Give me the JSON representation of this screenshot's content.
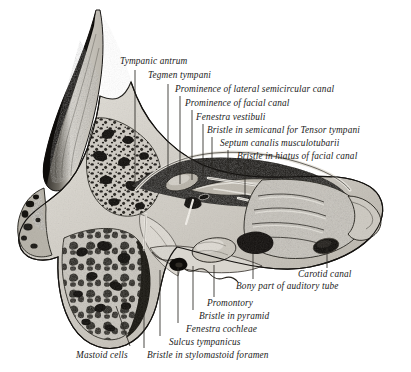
{
  "plate": {
    "title": "Dissected left temporal bone, tympanic cavity exposed",
    "background_color": "#ffffff",
    "ink_color": "#1a1a1a",
    "bone_light": "#d8d5ce",
    "bone_mid": "#a9a49a",
    "bone_dark": "#4a4640",
    "cavity_black": "#141210",
    "bristle_white": "#f4f2ec"
  },
  "labels": [
    {
      "id": "tympanic-antrum",
      "text": "Tympanic antrum",
      "x": 120,
      "y": 56,
      "align": "left",
      "leader": {
        "x1": 135,
        "y1": 70,
        "x2": 135,
        "y2": 186
      }
    },
    {
      "id": "tegmen-tympani",
      "text": "Tegmen tympani",
      "x": 148,
      "y": 70,
      "align": "left",
      "leader": {
        "x1": 168,
        "y1": 84,
        "x2": 168,
        "y2": 174
      }
    },
    {
      "id": "prominence-lateral-semicircular-canal",
      "text": "Prominence of lateral semicircular canal",
      "x": 175,
      "y": 84,
      "align": "left",
      "leader": {
        "x1": 180,
        "y1": 96,
        "x2": 180,
        "y2": 184
      }
    },
    {
      "id": "prominence-facial-canal",
      "text": "Prominence of facial canal",
      "x": 185,
      "y": 98,
      "align": "left",
      "leader": {
        "x1": 192,
        "y1": 110,
        "x2": 192,
        "y2": 180
      }
    },
    {
      "id": "fenestra-vestibuli",
      "text": "Fenestra vestibuli",
      "x": 196,
      "y": 112,
      "align": "left",
      "leader": {
        "x1": 203,
        "y1": 124,
        "x2": 203,
        "y2": 178
      }
    },
    {
      "id": "bristle-semicanal-tensor-tympani",
      "text": "Bristle in semicanal for Tensor tympani",
      "x": 207,
      "y": 125,
      "align": "left",
      "leader": {
        "x1": 212,
        "y1": 137,
        "x2": 212,
        "y2": 176
      }
    },
    {
      "id": "septum-canalis-musculotubarii",
      "text": "Septum canalis musculotubarii",
      "x": 220,
      "y": 138,
      "align": "left",
      "leader": {
        "x1": 228,
        "y1": 150,
        "x2": 228,
        "y2": 176
      }
    },
    {
      "id": "bristle-hiatus-facial-canal",
      "text": "Bristle in hiatus of facial canal",
      "x": 237,
      "y": 151,
      "align": "left",
      "leader": {
        "x1": 245,
        "y1": 163,
        "x2": 245,
        "y2": 197
      }
    },
    {
      "id": "carotid-canal",
      "text": "Carotid canal",
      "x": 298,
      "y": 269,
      "align": "left",
      "leader": {
        "x1": 327,
        "y1": 268,
        "x2": 327,
        "y2": 248
      }
    },
    {
      "id": "bony-part-auditory-tube",
      "text": "Bony part of auditory tube",
      "x": 236,
      "y": 281,
      "align": "left",
      "leader": {
        "x1": 253,
        "y1": 279,
        "x2": 253,
        "y2": 253
      }
    },
    {
      "id": "promontory",
      "text": "Promontory",
      "x": 207,
      "y": 298,
      "align": "left",
      "leader": {
        "x1": 214,
        "y1": 297,
        "x2": 214,
        "y2": 265
      }
    },
    {
      "id": "bristle-in-pyramid",
      "text": "Bristle in pyramid",
      "x": 199,
      "y": 311,
      "align": "left",
      "leader": {
        "x1": 193,
        "y1": 310,
        "x2": 193,
        "y2": 266
      }
    },
    {
      "id": "fenestra-cochleae",
      "text": "Fenestra cochleae",
      "x": 186,
      "y": 324,
      "align": "left",
      "leader": {
        "x1": 178,
        "y1": 323,
        "x2": 178,
        "y2": 268
      }
    },
    {
      "id": "sulcus-tympanicus",
      "text": "Sulcus tympanicus",
      "x": 169,
      "y": 337,
      "align": "left",
      "leader": {
        "x1": 160,
        "y1": 336,
        "x2": 160,
        "y2": 270
      }
    },
    {
      "id": "bristle-in-stylomastoid-foramen",
      "text": "Bristle in stylomastoid foramen",
      "x": 147,
      "y": 350,
      "align": "left",
      "leader": {
        "x1": 144,
        "y1": 348,
        "x2": 144,
        "y2": 249
      }
    },
    {
      "id": "mastoid-cells",
      "text": "Mastoid cells",
      "x": 76,
      "y": 350,
      "align": "left",
      "leader": {
        "x1": 130,
        "y1": 346,
        "x2": 116,
        "y2": 306
      }
    }
  ]
}
